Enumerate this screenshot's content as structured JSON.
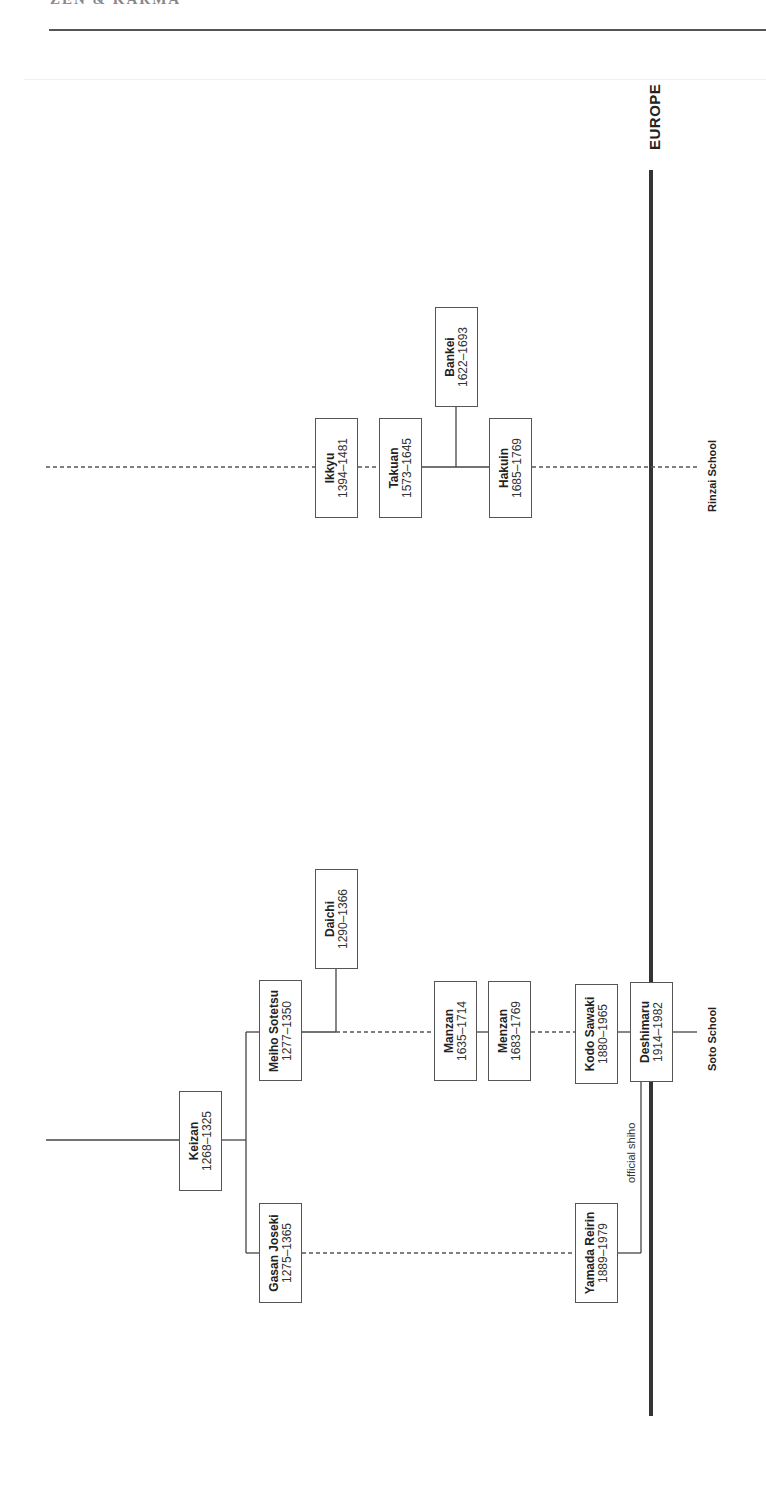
{
  "header": {
    "title": "ZEN & KARMA"
  },
  "region_label": "EUROPE",
  "schools": {
    "rinzai": "Rinzai School",
    "soto": "Soto School"
  },
  "annotation": {
    "official_shiho": "official shiho"
  },
  "nodes": {
    "keizan": {
      "name": "Keizan",
      "dates": "1268–1325"
    },
    "meiho": {
      "name": "Meiho Sotetsu",
      "dates": "1277–1350"
    },
    "gasan": {
      "name": "Gasan Joseki",
      "dates": "1275–1365"
    },
    "daichi": {
      "name": "Daichi",
      "dates": "1290–1366"
    },
    "ikkyu": {
      "name": "Ikkyu",
      "dates": "1394–1481"
    },
    "takuan": {
      "name": "Takuan",
      "dates": "1573–1645"
    },
    "bankei": {
      "name": "Bankei",
      "dates": "1622–1693"
    },
    "hakuin": {
      "name": "Hakuin",
      "dates": "1685–1769"
    },
    "manzan": {
      "name": "Manzan",
      "dates": "1635–1714"
    },
    "menzan": {
      "name": "Menzan",
      "dates": "1683–1769"
    },
    "kodo": {
      "name": "Kodo Sawaki",
      "dates": "1880–1965"
    },
    "deshimaru": {
      "name": "Deshimaru",
      "dates": "1914–1982"
    },
    "yamada": {
      "name": "Yamada Reirin",
      "dates": "1889–1979"
    }
  }
}
